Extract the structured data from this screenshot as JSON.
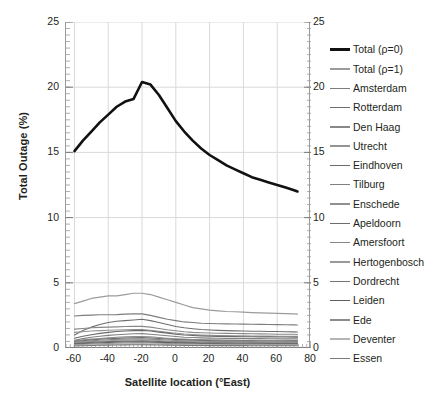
{
  "chart_data": {
    "type": "line",
    "title": "",
    "xlabel": "Satellite location (°East)",
    "ylabel": "Total Outage (%)",
    "xlim": [
      -65,
      80
    ],
    "ylim": [
      0,
      25
    ],
    "xticks": [
      -60,
      -40,
      -20,
      0,
      20,
      40,
      60,
      80
    ],
    "yticks": [
      0,
      5,
      10,
      15,
      20,
      25
    ],
    "y_right_ticks": [
      0,
      5,
      10,
      15,
      20,
      25
    ],
    "grid": true,
    "legend_position": "right",
    "x": [
      -60,
      -55,
      -50,
      -45,
      -40,
      -35,
      -30,
      -25,
      -20,
      -15,
      -10,
      -5,
      0,
      5,
      10,
      15,
      20,
      25,
      30,
      35,
      40,
      45,
      50,
      55,
      60,
      65,
      70,
      72
    ],
    "series": [
      {
        "name": "Total (ρ=0)",
        "color": "#111111",
        "width": 2.6,
        "values": [
          15.1,
          15.9,
          16.6,
          17.3,
          17.9,
          18.5,
          18.9,
          19.1,
          20.4,
          20.2,
          19.4,
          18.4,
          17.4,
          16.6,
          15.9,
          15.3,
          14.8,
          14.4,
          14.0,
          13.7,
          13.4,
          13.1,
          12.9,
          12.7,
          12.5,
          12.3,
          12.1,
          12.0
        ]
      },
      {
        "name": "Total (ρ=1)",
        "color": "#9b9b9b",
        "width": 1.2,
        "values": [
          3.4,
          3.6,
          3.8,
          3.9,
          4.0,
          4.0,
          4.1,
          4.2,
          4.2,
          4.1,
          3.9,
          3.7,
          3.5,
          3.3,
          3.1,
          3.0,
          2.9,
          2.85,
          2.8,
          2.78,
          2.75,
          2.72,
          2.7,
          2.68,
          2.66,
          2.64,
          2.62,
          2.6
        ]
      },
      {
        "name": "Amsterdam",
        "color": "#7d7d7d",
        "width": 1.1,
        "values": [
          2.45,
          2.5,
          2.52,
          2.55,
          2.55,
          2.56,
          2.6,
          2.62,
          2.62,
          2.5,
          2.35,
          2.2,
          2.1,
          2.0,
          1.95,
          1.9,
          1.88,
          1.86,
          1.85,
          1.84,
          1.83,
          1.82,
          1.81,
          1.8,
          1.79,
          1.78,
          1.77,
          1.76
        ]
      },
      {
        "name": "Rotterdam",
        "color": "#6f6f6f",
        "width": 1.1,
        "values": [
          1.0,
          1.35,
          1.6,
          1.8,
          1.95,
          2.05,
          2.1,
          2.15,
          2.2,
          2.1,
          1.95,
          1.8,
          1.65,
          1.55,
          1.48,
          1.42,
          1.38,
          1.35,
          1.33,
          1.31,
          1.3,
          1.29,
          1.28,
          1.27,
          1.26,
          1.25,
          1.24,
          1.23
        ]
      },
      {
        "name": "Den Haag",
        "color": "#888888",
        "width": 1.1,
        "values": [
          1.45,
          1.5,
          1.55,
          1.58,
          1.6,
          1.62,
          1.65,
          1.66,
          1.66,
          1.6,
          1.5,
          1.4,
          1.32,
          1.25,
          1.2,
          1.17,
          1.15,
          1.13,
          1.12,
          1.11,
          1.1,
          1.09,
          1.08,
          1.07,
          1.06,
          1.05,
          1.05,
          1.04
        ]
      },
      {
        "name": "Utrecht",
        "color": "#949494",
        "width": 1.1,
        "values": [
          1.2,
          1.25,
          1.3,
          1.33,
          1.36,
          1.38,
          1.4,
          1.42,
          1.42,
          1.36,
          1.28,
          1.2,
          1.13,
          1.07,
          1.03,
          1.0,
          0.98,
          0.96,
          0.95,
          0.94,
          0.93,
          0.92,
          0.92,
          0.91,
          0.9,
          0.9,
          0.89,
          0.89
        ]
      },
      {
        "name": "Eindhoven",
        "color": "#6a6a6a",
        "width": 1.1,
        "values": [
          0.75,
          0.9,
          1.02,
          1.12,
          1.2,
          1.26,
          1.3,
          1.33,
          1.35,
          1.3,
          1.22,
          1.14,
          1.06,
          1.0,
          0.96,
          0.93,
          0.91,
          0.89,
          0.88,
          0.87,
          0.86,
          0.86,
          0.85,
          0.85,
          0.84,
          0.84,
          0.83,
          0.83
        ]
      },
      {
        "name": "Tilburg",
        "color": "#808080",
        "width": 1.1,
        "values": [
          0.6,
          0.72,
          0.82,
          0.9,
          0.97,
          1.02,
          1.06,
          1.09,
          1.1,
          1.06,
          1.0,
          0.94,
          0.88,
          0.83,
          0.8,
          0.78,
          0.76,
          0.75,
          0.74,
          0.73,
          0.73,
          0.72,
          0.72,
          0.71,
          0.71,
          0.7,
          0.7,
          0.7
        ]
      },
      {
        "name": "Enschede",
        "color": "#909090",
        "width": 1.1,
        "values": [
          0.55,
          0.62,
          0.68,
          0.73,
          0.78,
          0.82,
          0.85,
          0.87,
          0.88,
          0.85,
          0.8,
          0.75,
          0.71,
          0.68,
          0.65,
          0.64,
          0.63,
          0.62,
          0.61,
          0.61,
          0.6,
          0.6,
          0.6,
          0.59,
          0.59,
          0.59,
          0.58,
          0.58
        ]
      },
      {
        "name": "Apeldoorn",
        "color": "#6d6d6d",
        "width": 1.1,
        "values": [
          0.5,
          0.56,
          0.62,
          0.67,
          0.71,
          0.74,
          0.77,
          0.79,
          0.8,
          0.77,
          0.73,
          0.69,
          0.65,
          0.62,
          0.6,
          0.58,
          0.57,
          0.56,
          0.56,
          0.55,
          0.55,
          0.55,
          0.54,
          0.54,
          0.54,
          0.53,
          0.53,
          0.53
        ]
      },
      {
        "name": "Amersfoort",
        "color": "#878787",
        "width": 1.1,
        "values": [
          0.45,
          0.5,
          0.55,
          0.59,
          0.63,
          0.66,
          0.68,
          0.7,
          0.71,
          0.68,
          0.64,
          0.61,
          0.58,
          0.55,
          0.53,
          0.52,
          0.51,
          0.5,
          0.5,
          0.49,
          0.49,
          0.49,
          0.48,
          0.48,
          0.48,
          0.48,
          0.47,
          0.47
        ]
      },
      {
        "name": "Hertogenbosch",
        "color": "#9a9a9a",
        "width": 1.1,
        "values": [
          0.4,
          0.45,
          0.49,
          0.53,
          0.56,
          0.59,
          0.61,
          0.62,
          0.63,
          0.61,
          0.57,
          0.54,
          0.51,
          0.49,
          0.47,
          0.46,
          0.45,
          0.45,
          0.44,
          0.44,
          0.44,
          0.43,
          0.43,
          0.43,
          0.43,
          0.42,
          0.42,
          0.42
        ]
      },
      {
        "name": "Dordrecht",
        "color": "#747474",
        "width": 1.1,
        "values": [
          0.35,
          0.39,
          0.43,
          0.46,
          0.49,
          0.51,
          0.53,
          0.54,
          0.55,
          0.53,
          0.5,
          0.47,
          0.45,
          0.43,
          0.41,
          0.4,
          0.4,
          0.39,
          0.39,
          0.38,
          0.38,
          0.38,
          0.38,
          0.37,
          0.37,
          0.37,
          0.37,
          0.37
        ]
      },
      {
        "name": "Leiden",
        "color": "#5f5f5f",
        "width": 1.1,
        "values": [
          0.3,
          0.34,
          0.37,
          0.4,
          0.42,
          0.44,
          0.46,
          0.47,
          0.47,
          0.45,
          0.43,
          0.41,
          0.39,
          0.37,
          0.36,
          0.35,
          0.34,
          0.34,
          0.33,
          0.33,
          0.33,
          0.33,
          0.32,
          0.32,
          0.32,
          0.32,
          0.32,
          0.32
        ]
      },
      {
        "name": "Ede",
        "color": "#8c8c8c",
        "width": 1.1,
        "values": [
          0.25,
          0.28,
          0.31,
          0.33,
          0.35,
          0.37,
          0.38,
          0.39,
          0.4,
          0.38,
          0.36,
          0.34,
          0.33,
          0.31,
          0.3,
          0.29,
          0.29,
          0.28,
          0.28,
          0.28,
          0.28,
          0.27,
          0.27,
          0.27,
          0.27,
          0.27,
          0.27,
          0.27
        ]
      },
      {
        "name": "Deventer",
        "color": "#b4b4b4",
        "width": 1.1,
        "values": [
          0.2,
          0.23,
          0.25,
          0.27,
          0.29,
          0.3,
          0.31,
          0.32,
          0.33,
          0.31,
          0.3,
          0.28,
          0.27,
          0.26,
          0.25,
          0.24,
          0.24,
          0.24,
          0.23,
          0.23,
          0.23,
          0.23,
          0.23,
          0.22,
          0.22,
          0.22,
          0.22,
          0.22
        ]
      },
      {
        "name": "Essen",
        "color": "#7a7a7a",
        "width": 1.1,
        "values": [
          0.15,
          0.17,
          0.19,
          0.21,
          0.22,
          0.23,
          0.24,
          0.25,
          0.25,
          0.24,
          0.23,
          0.22,
          0.21,
          0.2,
          0.19,
          0.19,
          0.18,
          0.18,
          0.18,
          0.18,
          0.18,
          0.17,
          0.17,
          0.17,
          0.17,
          0.17,
          0.17,
          0.17
        ]
      }
    ]
  }
}
